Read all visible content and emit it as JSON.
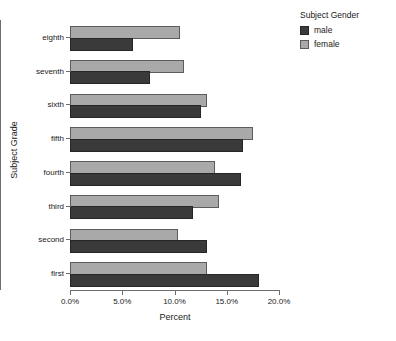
{
  "chart_data": {
    "type": "bar",
    "orientation": "horizontal",
    "grouping": "clustered",
    "title": "",
    "xlabel": "Percent",
    "ylabel": "Subject Grade",
    "categories": [
      "eighth",
      "seventh",
      "sixth",
      "fifth",
      "fourth",
      "third",
      "second",
      "first"
    ],
    "series": [
      {
        "name": "male",
        "color": "#3a3a3a",
        "values": [
          6.0,
          7.7,
          12.5,
          16.6,
          16.4,
          11.8,
          13.1,
          18.1
        ]
      },
      {
        "name": "female",
        "color": "#a9a9a9",
        "values": [
          10.5,
          10.9,
          13.1,
          17.5,
          13.9,
          14.3,
          10.3,
          13.1
        ]
      }
    ],
    "xlim": [
      0,
      20
    ],
    "xticks": [
      0,
      5,
      10,
      15,
      20
    ],
    "xtick_labels": [
      "0.0%",
      "5.0%",
      "10.0%",
      "15.0%",
      "20.0%"
    ],
    "grid": false,
    "legend_position": "right"
  },
  "legend": {
    "title": "Subject Gender",
    "entries": [
      {
        "label": "male"
      },
      {
        "label": "female"
      }
    ]
  }
}
